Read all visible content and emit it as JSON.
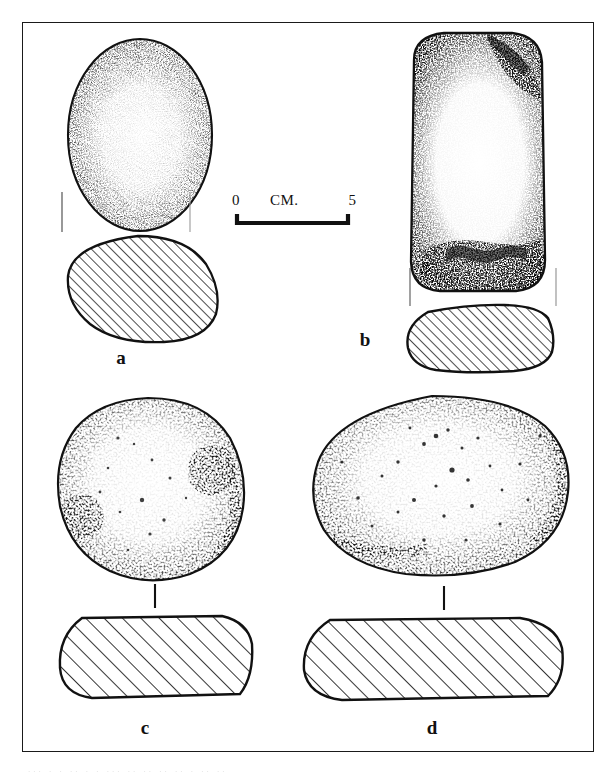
{
  "figure": {
    "kind": "archaeological-artifact-plate",
    "medium": "ink stipple and hatch line drawing",
    "frame_border_color": "#1a1a1a",
    "background_color": "#ffffff",
    "ink_color": "#111111",
    "scan_noise_text": "...   .  .    ..  .   . ... .. ..  .. ..  . ..  .."
  },
  "scale_bar": {
    "name": "metric-scale-bar",
    "left_value": "0",
    "unit_label": "CM.",
    "right_value": "5",
    "span_cm": 5,
    "style": "bracket"
  },
  "artifacts": [
    {
      "id": "a",
      "label": "a",
      "views": [
        "plan",
        "cross-section"
      ],
      "plan": {
        "outline": "oval",
        "surface_texture": "fine even stipple, denser toward the margins",
        "condition": "intact, unbroken margin"
      },
      "section": {
        "outline": "rounded sub-circular",
        "fill": "diagonal hatch",
        "hatch_direction": "lower-left to upper-right"
      },
      "registration_ticks": 2
    },
    {
      "id": "b",
      "label": "b",
      "views": [
        "plan",
        "cross-section"
      ],
      "plan": {
        "outline": "elongated rounded rectangle",
        "surface_texture": "dense dark stipple along margins, pale centre",
        "condition": "battered / spalled at upper right and lower end"
      },
      "section": {
        "outline": "rounded rectangle, flattened",
        "fill": "diagonal hatch",
        "hatch_direction": "lower-left to upper-right"
      },
      "registration_ticks": 2
    },
    {
      "id": "c",
      "label": "c",
      "views": [
        "plan",
        "cross-section"
      ],
      "plan": {
        "outline": "sub-circular disc",
        "surface_texture": "coarse stipple with pitted depressions",
        "condition": "pitted, two pecked hollows"
      },
      "section": {
        "outline": "flattened lozenge / rounded rectangle",
        "fill": "wide diagonal hatch",
        "hatch_direction": "lower-left to upper-right"
      },
      "connector": "vertical tick linking plan to section"
    },
    {
      "id": "d",
      "label": "d",
      "views": [
        "plan",
        "cross-section"
      ],
      "plan": {
        "outline": "wide oval / rounded rectangle",
        "surface_texture": "coarse stipple, scattered interior pecking",
        "condition": "heavily pecked working face"
      },
      "section": {
        "outline": "wide flattened rounded rectangle",
        "fill": "wide diagonal hatch",
        "hatch_direction": "lower-left to upper-right"
      },
      "connector": "vertical tick linking plan to section"
    }
  ]
}
